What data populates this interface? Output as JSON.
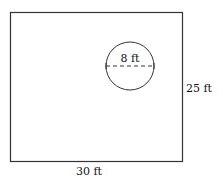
{
  "diagram": {
    "rectangle": {
      "width_label": "30 ft",
      "height_label": "25 ft",
      "stroke": "#333333"
    },
    "circle": {
      "diameter_label": "8 ft",
      "stroke": "#333333"
    }
  }
}
